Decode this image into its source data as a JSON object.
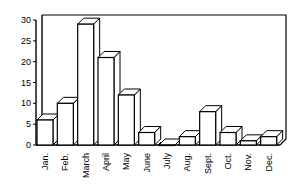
{
  "chart_data": {
    "type": "bar",
    "title": "",
    "xlabel": "",
    "ylabel": "",
    "categories": [
      "Jan.",
      "Feb.",
      "March",
      "April",
      "May",
      "June",
      "July",
      "Aug.",
      "Sept.",
      "Oct.",
      "Nov.",
      "Dec."
    ],
    "values": [
      6,
      10,
      29,
      21,
      12,
      3,
      0,
      2,
      8,
      3,
      1,
      2
    ],
    "ylim": [
      0,
      30
    ],
    "yticks": [
      "0",
      "5",
      "10",
      "15",
      "20",
      "25",
      "30"
    ],
    "grid": false,
    "style": "3d-bar"
  }
}
